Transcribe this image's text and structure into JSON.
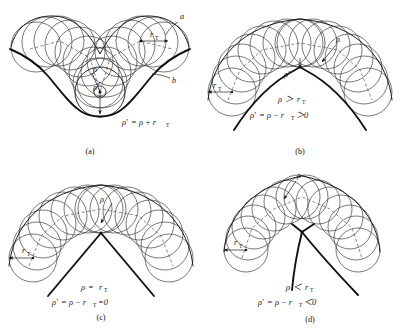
{
  "figure": {
    "background_color": "#ffffff",
    "ink_color": "#121212",
    "layout": "2x2 grid of four sub-figures",
    "symbols": {
      "rho": "ρ",
      "rho_prime": "ρ′",
      "r": "r",
      "T": "T",
      "a": "a",
      "b": "b"
    }
  },
  "panels": [
    {
      "id": "a",
      "caption": "(a)",
      "shape": "concave V-shaped valley with rolling tool circles, envelope above",
      "labels": {
        "curve_a": "a",
        "curve_b": "b",
        "tool_radius": "r",
        "tool_radius_sub": "T",
        "rho": "ρ",
        "rho_prime": "ρ′"
      },
      "formulas": [
        {
          "lhs": "ρ′",
          "op": "=",
          "rhs": "ρ + r",
          "rhs_sub": "T",
          "text": "ρ′=ρ+r_T"
        }
      ]
    },
    {
      "id": "b",
      "caption": "(b)",
      "shape": "convex arch (inverted V) with rolling tool circles outside, sharp cusp at apex",
      "labels": {
        "tool_radius": "r",
        "tool_radius_sub": "T",
        "rho": "ρ",
        "rho_prime": "ρ′"
      },
      "formulas": [
        {
          "text": "ρ > r_T",
          "lhs": "ρ",
          "op": "＞",
          "rhs": "r",
          "rhs_sub": "T"
        },
        {
          "text": "ρ′ = ρ − r_T > 0",
          "lhs": "ρ′",
          "op": "=",
          "rhs": "ρ − r",
          "rhs_sub": "T",
          "tail": "＞0"
        }
      ]
    },
    {
      "id": "c",
      "caption": "(c)",
      "shape": "convex arch with rolling tool circles meeting at a single degenerate point",
      "labels": {
        "tool_radius": "r",
        "tool_radius_sub": "T",
        "rho": "ρ"
      },
      "formulas": [
        {
          "text": "ρ = r_T",
          "lhs": "ρ",
          "op": "=",
          "rhs": "r",
          "rhs_sub": "T"
        },
        {
          "text": "ρ′ = ρ − r_T = 0",
          "lhs": "ρ′",
          "op": "=",
          "rhs": "ρ − r",
          "rhs_sub": "T",
          "tail": "=0"
        }
      ]
    },
    {
      "id": "d",
      "caption": "(d)",
      "shape": "self-intersecting crossed curves, tool circles overlap past the cusp",
      "labels": {
        "tool_radius": "r",
        "tool_radius_sub": "T",
        "rho": "ρ"
      },
      "formulas": [
        {
          "text": "ρ < r_T",
          "lhs": "ρ",
          "op": "＜",
          "rhs": "r",
          "rhs_sub": "T"
        },
        {
          "text": "ρ′ = ρ − r_T < 0",
          "lhs": "ρ′",
          "op": "=",
          "rhs": "ρ − r",
          "rhs_sub": "T",
          "tail": "＜0"
        }
      ]
    }
  ]
}
